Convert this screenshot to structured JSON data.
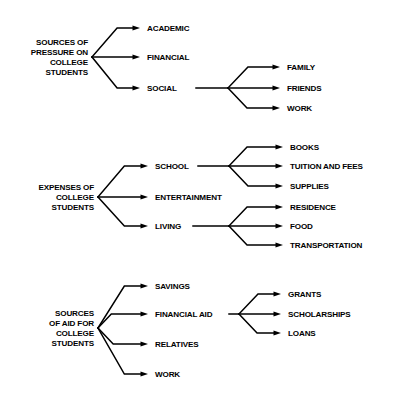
{
  "page": {
    "background_color": "#ffffff",
    "ink_color": "#000000",
    "width": 401,
    "height": 395
  },
  "diagrams": [
    {
      "id": "pressure",
      "root": {
        "lines": [
          "SOURCES OF",
          "PRESSURE ON",
          "COLLEGE",
          "STUDENTS"
        ],
        "x": 88,
        "y": 57,
        "vertex_x": 92
      },
      "branches": [
        {
          "label": "ACADEMIC",
          "y": 28,
          "arrow_end_x": 140,
          "text_x": 147,
          "children": []
        },
        {
          "label": "FINANCIAL",
          "y": 57,
          "arrow_end_x": 140,
          "text_x": 147,
          "children": []
        },
        {
          "label": "SOCIAL",
          "y": 88,
          "arrow_end_x": 140,
          "text_x": 147,
          "sub_vertex_x": 228,
          "connector_start_x": 196,
          "children": [
            {
              "label": "FAMILY",
              "y": 67,
              "arrow_end_x": 280,
              "text_x": 287
            },
            {
              "label": "FRIENDS",
              "y": 88,
              "arrow_end_x": 280,
              "text_x": 287
            },
            {
              "label": "WORK",
              "y": 108,
              "arrow_end_x": 280,
              "text_x": 287
            }
          ]
        }
      ]
    },
    {
      "id": "expenses",
      "root": {
        "lines": [
          "EXPENSES OF",
          "COLLEGE",
          "STUDENTS"
        ],
        "x": 94,
        "y": 197,
        "vertex_x": 98
      },
      "branches": [
        {
          "label": "SCHOOL",
          "y": 166,
          "arrow_end_x": 148,
          "text_x": 155,
          "sub_vertex_x": 229,
          "connector_start_x": 198,
          "children": [
            {
              "label": "BOOKS",
              "y": 147,
              "arrow_end_x": 283,
              "text_x": 290
            },
            {
              "label": "TUITION AND FEES",
              "y": 166,
              "arrow_end_x": 283,
              "text_x": 290
            },
            {
              "label": "SUPPLIES",
              "y": 186,
              "arrow_end_x": 283,
              "text_x": 290
            }
          ]
        },
        {
          "label": "ENTERTAINMENT",
          "y": 197,
          "arrow_end_x": 148,
          "text_x": 155,
          "children": []
        },
        {
          "label": "LIVING",
          "y": 226,
          "arrow_end_x": 148,
          "text_x": 155,
          "sub_vertex_x": 229,
          "connector_start_x": 193,
          "children": [
            {
              "label": "RESIDENCE",
              "y": 207,
              "arrow_end_x": 283,
              "text_x": 290
            },
            {
              "label": "FOOD",
              "y": 226,
              "arrow_end_x": 283,
              "text_x": 290
            },
            {
              "label": "TRANSPORTATION",
              "y": 245,
              "arrow_end_x": 283,
              "text_x": 290
            }
          ]
        }
      ]
    },
    {
      "id": "aid",
      "root": {
        "lines": [
          "SOURCES",
          "OF AID FOR",
          "COLLEGE",
          "STUDENTS"
        ],
        "x": 94,
        "y": 328,
        "vertex_x": 98
      },
      "branches": [
        {
          "label": "SAVINGS",
          "y": 286,
          "arrow_end_x": 148,
          "text_x": 155,
          "children": []
        },
        {
          "label": "FINANCIAL AID",
          "y": 314,
          "arrow_end_x": 148,
          "text_x": 155,
          "sub_vertex_x": 239,
          "connector_start_x": 229,
          "children": [
            {
              "label": "GRANTS",
              "y": 294,
              "arrow_end_x": 281,
              "text_x": 288
            },
            {
              "label": "SCHOLARSHIPS",
              "y": 314,
              "arrow_end_x": 281,
              "text_x": 288
            },
            {
              "label": "LOANS",
              "y": 333,
              "arrow_end_x": 281,
              "text_x": 288
            }
          ]
        },
        {
          "label": "RELATIVES",
          "y": 344,
          "arrow_end_x": 148,
          "text_x": 155,
          "children": []
        },
        {
          "label": "WORK",
          "y": 374,
          "arrow_end_x": 148,
          "text_x": 155,
          "children": []
        }
      ]
    }
  ]
}
